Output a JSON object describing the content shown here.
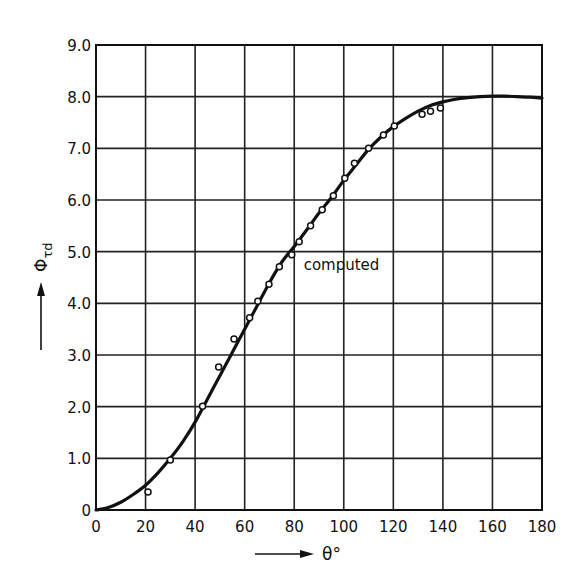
{
  "chart_data": {
    "type": "line",
    "title": "",
    "xlabel": "θ°",
    "ylabel": "Φτd",
    "xlim": [
      0,
      180
    ],
    "ylim": [
      0,
      9.0
    ],
    "grid": true,
    "legend": null,
    "x_ticks": [
      0,
      20,
      40,
      60,
      80,
      100,
      120,
      140,
      160,
      180
    ],
    "x_tick_labels": [
      "0",
      "20",
      "40",
      "60",
      "80",
      "100",
      "120",
      "140",
      "160",
      "180"
    ],
    "y_ticks": [
      0,
      1,
      2,
      3,
      4,
      5,
      6,
      7,
      8,
      9
    ],
    "y_tick_labels": [
      "0",
      "1.0",
      "2.0",
      "3.0",
      "4.0",
      "5.0",
      "6.0",
      "7.0",
      "8.0",
      "9.0"
    ],
    "annotations": [
      {
        "text": "computed",
        "x": 83,
        "y": 4.75
      }
    ],
    "series": [
      {
        "name": "computed",
        "kind": "line",
        "x": [
          0,
          5,
          10,
          15,
          20,
          25,
          30,
          35,
          40,
          45,
          50,
          55,
          60,
          65,
          70,
          75,
          80,
          85,
          90,
          95,
          100,
          105,
          110,
          115,
          120,
          125,
          130,
          135,
          140,
          145,
          150,
          155,
          160,
          165,
          170,
          175,
          180
        ],
        "y": [
          0,
          0.05,
          0.15,
          0.3,
          0.48,
          0.72,
          1.0,
          1.32,
          1.7,
          2.15,
          2.6,
          3.05,
          3.5,
          3.95,
          4.4,
          4.8,
          5.1,
          5.42,
          5.75,
          6.05,
          6.38,
          6.68,
          6.98,
          7.22,
          7.42,
          7.58,
          7.72,
          7.83,
          7.9,
          7.95,
          7.98,
          8.0,
          8.01,
          8.01,
          8.0,
          7.99,
          7.97
        ]
      },
      {
        "name": "measured",
        "kind": "scatter",
        "x": [
          21,
          30,
          43,
          49.5,
          55.7,
          62,
          65.3,
          69.8,
          74,
          79,
          82,
          86.6,
          91.3,
          95.8,
          100.4,
          104.3,
          110,
          116,
          120.4,
          131.6,
          135,
          139
        ],
        "y": [
          0.35,
          0.97,
          2.01,
          2.77,
          3.31,
          3.72,
          4.04,
          4.37,
          4.71,
          4.94,
          5.19,
          5.5,
          5.81,
          6.08,
          6.42,
          6.71,
          7.0,
          7.26,
          7.43,
          7.66,
          7.72,
          7.78
        ]
      }
    ]
  },
  "labels": {
    "x_axis": "θ°",
    "y_axis_main": "Φ",
    "y_axis_sub": "τd",
    "annotation": "computed"
  }
}
